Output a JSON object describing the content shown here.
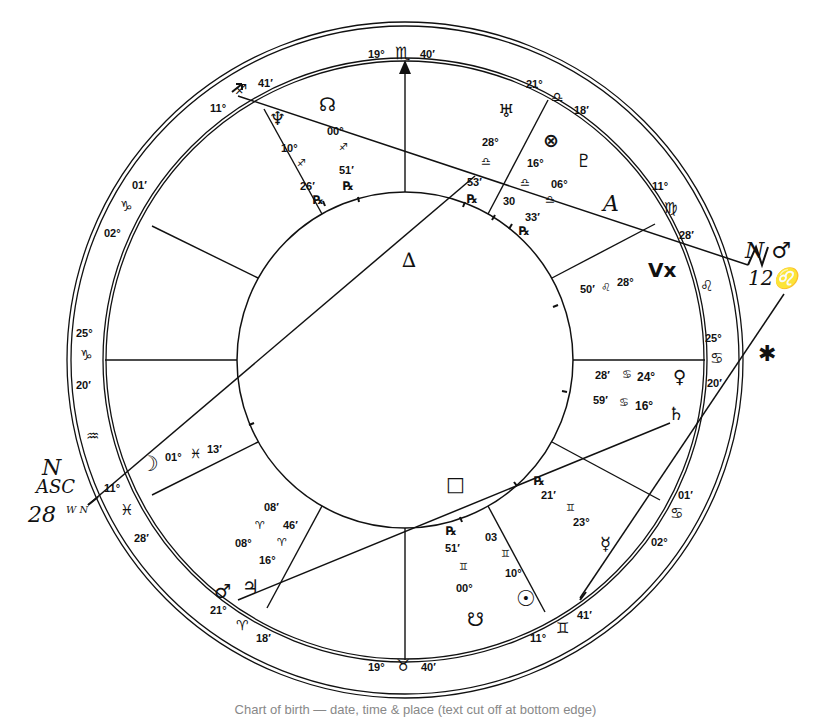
{
  "chart": {
    "center": [
      405,
      360
    ],
    "radii": {
      "outer": 338,
      "inner_ring": 300,
      "inner_circle": 168
    },
    "ink_color": "#111111"
  },
  "cusps": {
    "mc": {
      "deg": "19°",
      "sign": "♏",
      "min": "40′"
    },
    "ic": {
      "deg": "19°",
      "sign": "♉",
      "min": "40′"
    },
    "h11": {
      "deg": "21°",
      "sign": "♎",
      "min": "18′"
    },
    "h12": {
      "deg": "11°",
      "sign": "♍",
      "min": "28′"
    },
    "asc": {
      "deg": "25°",
      "sign": "♋",
      "min": "20′"
    },
    "h2": {
      "deg": "02°",
      "sign": "♋",
      "min": "01′"
    },
    "h3": {
      "deg": "11°",
      "sign": "♊",
      "min": "41′"
    },
    "h5": {
      "deg": "21°",
      "sign": "♈",
      "min": "18′"
    },
    "h6": {
      "deg": "11°",
      "sign": "♓",
      "min": "28′"
    },
    "dsc": {
      "deg": "25°",
      "sign": "♑",
      "min": "20′"
    },
    "h8": {
      "deg": "02°",
      "sign": "♑",
      "min": "01′"
    },
    "h9": {
      "deg": "11°",
      "sign": "♐",
      "min": "41′"
    },
    "h7_sign": "♒",
    "h12_sign2": "♌"
  },
  "planets": {
    "neptune": {
      "glyph": "♆",
      "deg": "10°",
      "sign": "♐",
      "min": "26′",
      "retro": "℞"
    },
    "node": {
      "glyph": "☊",
      "deg": "00°",
      "sign": "♐",
      "min": "51′",
      "retro": "℞"
    },
    "uranus": {
      "glyph": "♅",
      "deg": "28°",
      "sign": "♎",
      "min": "53′",
      "retro": "℞"
    },
    "fortune": {
      "glyph": "⊗",
      "deg": "16°",
      "sign": "♎",
      "min": "30"
    },
    "pluto": {
      "glyph": "♇",
      "deg": "06°",
      "sign": "♎",
      "min": "33′",
      "retro": "℞"
    },
    "vertex": {
      "glyph": "Vx",
      "deg": "28°",
      "sign": "♌",
      "min": "50′"
    },
    "venus": {
      "glyph": "♀",
      "deg": "24°",
      "sign": "♋",
      "min": "28′"
    },
    "saturn": {
      "glyph": "♄",
      "deg": "16°",
      "sign": "♋",
      "min": "59′"
    },
    "mercury": {
      "glyph": "☿",
      "deg": "23°",
      "sign": "♊",
      "min": "21′",
      "retro": "℞"
    },
    "sun": {
      "glyph": "☉",
      "deg": "10°",
      "sign": "♊",
      "min": "03"
    },
    "south_node": {
      "glyph": "☋",
      "deg": "00°",
      "sign": "♊",
      "min": "51′",
      "retro": "℞"
    },
    "mars": {
      "glyph": "♂",
      "deg": "08°",
      "sign": "♈",
      "min": "08′"
    },
    "jupiter": {
      "glyph": "♃",
      "deg": "16°",
      "sign": "♈",
      "min": "46′"
    },
    "moon": {
      "glyph": "☽",
      "deg": "01°",
      "sign": "♓",
      "min": "13′"
    }
  },
  "annotations": {
    "hand_triangle": "∆",
    "hand_square": "□",
    "hand_a": "A",
    "star": "✱",
    "north_node_note_line1": "N ♂",
    "north_node_note_line2": "12♌",
    "asc_note_line1": "N",
    "asc_note_line2": "ASC",
    "asc_note_line3": "28",
    "asc_note_sub": "W N"
  },
  "caption": "Chart of birth — date, time & place (text cut off at bottom edge)"
}
